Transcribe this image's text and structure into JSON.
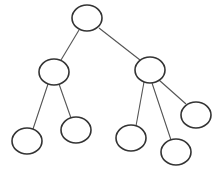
{
  "diagram": {
    "type": "tree",
    "canvas": {
      "width": 222,
      "height": 172,
      "background": "#ffffff"
    },
    "style": {
      "node_stroke": "#333333",
      "edge_stroke": "#555555",
      "node_fill": "#ffffff"
    },
    "nodes": [
      {
        "id": "root",
        "cx": 87,
        "cy": 18,
        "rx": 15,
        "ry": 13,
        "label": ""
      },
      {
        "id": "left",
        "cx": 54,
        "cy": 72,
        "rx": 15,
        "ry": 13,
        "label": ""
      },
      {
        "id": "right",
        "cx": 150,
        "cy": 70,
        "rx": 15,
        "ry": 13,
        "label": ""
      },
      {
        "id": "left-leaf-1",
        "cx": 27,
        "cy": 141,
        "rx": 15,
        "ry": 13,
        "label": ""
      },
      {
        "id": "left-leaf-2",
        "cx": 76,
        "cy": 130,
        "rx": 15,
        "ry": 13,
        "label": ""
      },
      {
        "id": "right-leaf-1",
        "cx": 131,
        "cy": 138,
        "rx": 15,
        "ry": 13,
        "label": ""
      },
      {
        "id": "right-leaf-2",
        "cx": 176,
        "cy": 152,
        "rx": 15,
        "ry": 13,
        "label": ""
      },
      {
        "id": "right-leaf-3",
        "cx": 196,
        "cy": 115,
        "rx": 15,
        "ry": 13,
        "label": ""
      }
    ],
    "edges": [
      {
        "from": "root",
        "to": "left",
        "x1": 79,
        "y1": 30,
        "x2": 61,
        "y2": 60
      },
      {
        "from": "root",
        "to": "right",
        "x1": 99,
        "y1": 28,
        "x2": 140,
        "y2": 60
      },
      {
        "from": "left",
        "to": "left-leaf-1",
        "x1": 48,
        "y1": 84,
        "x2": 33,
        "y2": 129
      },
      {
        "from": "left",
        "to": "left-leaf-2",
        "x1": 59,
        "y1": 84,
        "x2": 71,
        "y2": 118
      },
      {
        "from": "right",
        "to": "right-leaf-1",
        "x1": 144,
        "y1": 82,
        "x2": 136,
        "y2": 126
      },
      {
        "from": "right",
        "to": "right-leaf-2",
        "x1": 152,
        "y1": 83,
        "x2": 171,
        "y2": 140
      },
      {
        "from": "right",
        "to": "right-leaf-3",
        "x1": 159,
        "y1": 80,
        "x2": 186,
        "y2": 104
      }
    ]
  }
}
